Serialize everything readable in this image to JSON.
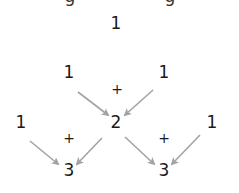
{
  "diagram": {
    "top_cut_text_fragments": [
      {
        "glyph": "g",
        "x": 70
      },
      {
        "glyph": "g",
        "x": 170
      }
    ],
    "rows": [
      {
        "nodes": [
          {
            "value": "1",
            "x": 116,
            "y": 15
          }
        ]
      },
      {
        "nodes": [
          {
            "value": "1",
            "x": 69,
            "y": 64
          },
          {
            "value": "1",
            "x": 164,
            "y": 64
          }
        ]
      },
      {
        "nodes": [
          {
            "value": "1",
            "x": 21,
            "y": 114
          },
          {
            "value": "2",
            "x": 116,
            "y": 114
          },
          {
            "value": "1",
            "x": 212,
            "y": 114
          }
        ]
      },
      {
        "nodes": [
          {
            "value": "3",
            "x": 69,
            "y": 162
          },
          {
            "value": "3",
            "x": 164,
            "y": 162
          }
        ]
      }
    ],
    "operators": [
      {
        "symbol": "+",
        "x": 117,
        "y": 82
      },
      {
        "symbol": "+",
        "x": 69,
        "y": 131
      },
      {
        "symbol": "+",
        "x": 164,
        "y": 131
      }
    ],
    "arrows": [
      {
        "from": [
          78,
          92
        ],
        "to": [
          108,
          115
        ]
      },
      {
        "from": [
          153,
          90
        ],
        "to": [
          125,
          115
        ]
      },
      {
        "from": [
          30,
          141
        ],
        "to": [
          58,
          164
        ]
      },
      {
        "from": [
          102,
          138
        ],
        "to": [
          77,
          164
        ]
      },
      {
        "from": [
          125,
          137
        ],
        "to": [
          154,
          164
        ]
      },
      {
        "from": [
          200,
          135
        ],
        "to": [
          172,
          164
        ]
      }
    ],
    "colors": {
      "text": "#1a1a1a",
      "arrow": "#a3a3a3",
      "background": "#ffffff"
    }
  }
}
